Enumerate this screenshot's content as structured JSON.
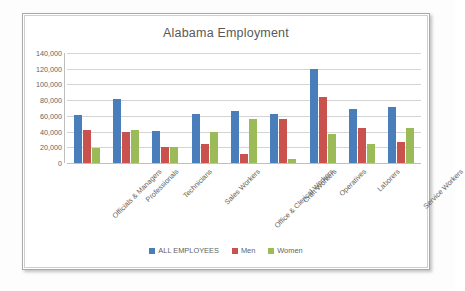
{
  "chart_data": {
    "type": "bar",
    "title": "Alabama Employment",
    "xlabel": "",
    "ylabel": "",
    "ylim": [
      0,
      140000
    ],
    "yticks": [
      0,
      20000,
      40000,
      60000,
      80000,
      100000,
      120000,
      140000
    ],
    "ytick_labels": [
      "0",
      "20,000",
      "40,000",
      "60,000",
      "80,000",
      "100,000",
      "120,000",
      "140,000"
    ],
    "grid": true,
    "legend_position": "bottom",
    "categories": [
      "Officials & Managers",
      "Professionals",
      "Technicians",
      "Sales Workers",
      "Office & Clerical Workers",
      "Craft Workers",
      "Operatives",
      "Laborers",
      "Service Workers"
    ],
    "series": [
      {
        "name": "ALL EMPLOYEES",
        "color": "#4A7EBB",
        "values": [
          61000,
          81000,
          41000,
          63000,
          66000,
          62000,
          120000,
          69000,
          71000
        ]
      },
      {
        "name": "Men",
        "color": "#C9524F",
        "values": [
          42000,
          40000,
          20000,
          24000,
          11000,
          56000,
          84000,
          45000,
          27000
        ]
      },
      {
        "name": "Women",
        "color": "#9BBB59",
        "values": [
          19500,
          42000,
          20000,
          39000,
          56000,
          5000,
          37000,
          24000,
          44000
        ]
      }
    ]
  }
}
